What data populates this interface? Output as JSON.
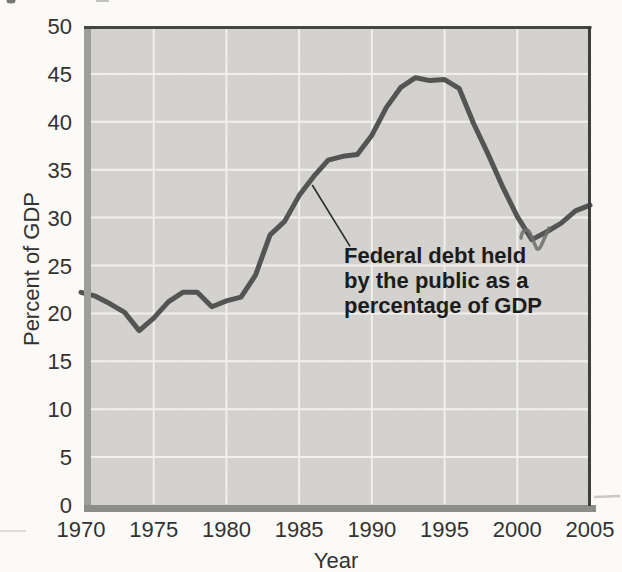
{
  "figure": {
    "background": "#fbfaf7"
  },
  "chart_data": {
    "type": "line",
    "title": "",
    "xlabel": "Year",
    "ylabel": "Percent of GDP",
    "xlim": [
      1970,
      2005
    ],
    "ylim": [
      0,
      50
    ],
    "x_ticks": [
      1970,
      1975,
      1980,
      1985,
      1990,
      1995,
      2000,
      2005
    ],
    "y_ticks": [
      0,
      5,
      10,
      15,
      20,
      25,
      30,
      35,
      40,
      45,
      50
    ],
    "grid": true,
    "legend_position": "none",
    "plot_background": "#d3d2cf",
    "gridline_color": "#f1f0ed",
    "series": [
      {
        "name": "Federal debt held by the public as a percentage of GDP",
        "color": "#545454",
        "x": [
          1970,
          1971,
          1972,
          1973,
          1974,
          1975,
          1976,
          1977,
          1978,
          1979,
          1980,
          1981,
          1982,
          1983,
          1984,
          1985,
          1986,
          1987,
          1988,
          1989,
          1990,
          1991,
          1992,
          1993,
          1994,
          1995,
          1996,
          1997,
          1998,
          1999,
          2000,
          2001,
          2002,
          2003,
          2004,
          2005
        ],
        "values": [
          22.2,
          21.8,
          21.0,
          20.1,
          18.2,
          19.5,
          21.2,
          22.2,
          22.2,
          20.7,
          21.3,
          21.7,
          24.0,
          28.2,
          29.6,
          32.3,
          34.3,
          36.0,
          36.4,
          36.6,
          38.6,
          41.5,
          43.6,
          44.6,
          44.3,
          44.4,
          43.5,
          39.8,
          36.6,
          33.2,
          30.1,
          27.7,
          28.5,
          29.4,
          30.7,
          31.3
        ]
      }
    ],
    "annotation": {
      "lines": [
        "Federal debt held",
        "by the public as a",
        "percentage of GDP"
      ],
      "leader_from": {
        "year": 1985.9,
        "value": 33.4
      },
      "leader_to": {
        "year": 1988.5,
        "value": 27.0
      }
    }
  }
}
